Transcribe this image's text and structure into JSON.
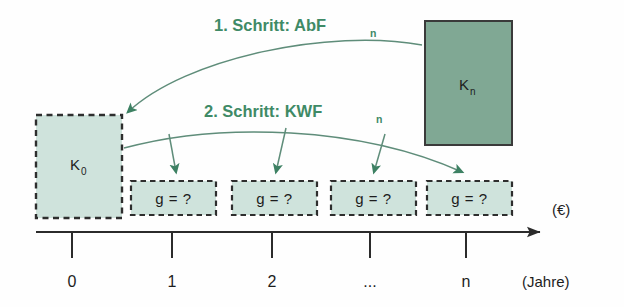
{
  "diagram": {
    "colors": {
      "fill_light": "#cfe3dc",
      "fill_dark": "#80a894",
      "border_dark": "#3a3a3a",
      "arrow_green": "#3d8163",
      "curve_stroke": "#5f8d7a",
      "text_green": "#3f8a66",
      "text_black": "#1d1d1d",
      "axis_black": "#2b2b2b"
    },
    "steps": [
      {
        "id": "step1",
        "label": "1. Schritt: AbF",
        "sub": "n"
      },
      {
        "id": "step2",
        "label": "2. Schritt: KWF",
        "sub": "n"
      }
    ],
    "capital_boxes": [
      {
        "id": "k0",
        "label": "K",
        "sub": "0",
        "style": "dashed-light"
      },
      {
        "id": "kn",
        "label": "K",
        "sub": "n",
        "style": "solid-dark"
      }
    ],
    "payment_boxes": [
      {
        "id": "g1",
        "label": "g = ?"
      },
      {
        "id": "g2",
        "label": "g = ?"
      },
      {
        "id": "g3",
        "label": "g = ?"
      },
      {
        "id": "g4",
        "label": "g = ?"
      }
    ],
    "axis": {
      "ticks": [
        "0",
        "1",
        "2",
        "...",
        "n"
      ],
      "value_axis_label": "(€)",
      "time_axis_label": "(Jahre)"
    }
  }
}
